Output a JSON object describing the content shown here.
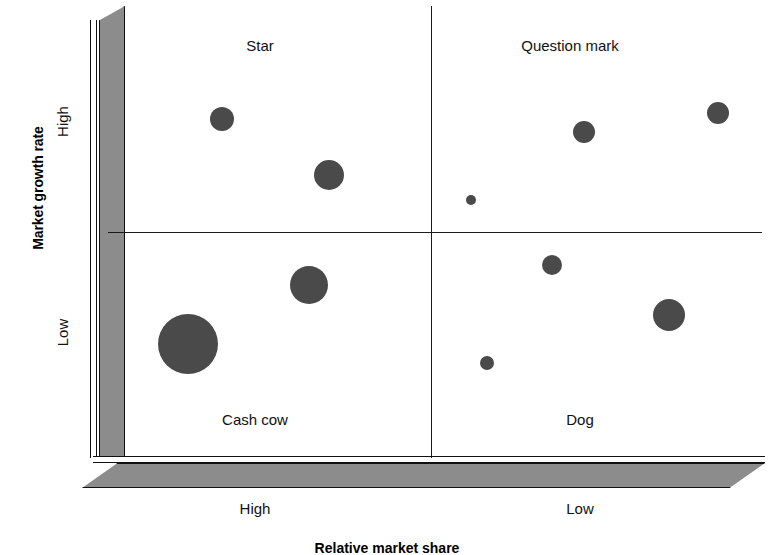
{
  "chart_data": {
    "type": "scatter",
    "xlabel": "Relative market share",
    "ylabel": "Market growth rate",
    "x_ticks": [
      "High",
      "Low"
    ],
    "y_ticks": [
      "High",
      "Low"
    ],
    "grid": false,
    "legend": "none",
    "quadrants": [
      {
        "id": "star",
        "label": "Star",
        "x_level": "High",
        "y_level": "High"
      },
      {
        "id": "question",
        "label": "Question mark",
        "x_level": "Low",
        "y_level": "High"
      },
      {
        "id": "cashcow",
        "label": "Cash cow",
        "x_level": "High",
        "y_level": "Low"
      },
      {
        "id": "dog",
        "label": "Dog",
        "x_level": "Low",
        "y_level": "Low"
      }
    ],
    "points": [
      {
        "quadrant": "star",
        "cx": 222,
        "cy": 119,
        "r": 12
      },
      {
        "quadrant": "star",
        "cx": 329,
        "cy": 175,
        "r": 15
      },
      {
        "quadrant": "question",
        "cx": 584,
        "cy": 132,
        "r": 11
      },
      {
        "quadrant": "question",
        "cx": 718,
        "cy": 113,
        "r": 11
      },
      {
        "quadrant": "question",
        "cx": 471,
        "cy": 200,
        "r": 5
      },
      {
        "quadrant": "cashcow",
        "cx": 309,
        "cy": 285,
        "r": 19
      },
      {
        "quadrant": "cashcow",
        "cx": 188,
        "cy": 344,
        "r": 30
      },
      {
        "quadrant": "dog",
        "cx": 552,
        "cy": 265,
        "r": 10
      },
      {
        "quadrant": "dog",
        "cx": 669,
        "cy": 315,
        "r": 16
      },
      {
        "quadrant": "dog",
        "cx": 487,
        "cy": 363,
        "r": 7
      }
    ],
    "colors": {
      "bubble": "#4a4a4a",
      "axis_bar": "#8c8c8c",
      "line": "#1a1a1a",
      "background": "#ffffff"
    }
  },
  "axes": {
    "y_title": "Market growth rate",
    "y_high": "High",
    "y_low": "Low",
    "x_title": "Relative market share",
    "x_high": "High",
    "x_low": "Low"
  },
  "quadrant_labels": {
    "star": "Star",
    "question": "Question mark",
    "cashcow": "Cash cow",
    "dog": "Dog"
  }
}
